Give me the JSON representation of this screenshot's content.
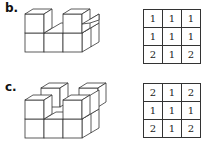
{
  "problems": [
    {
      "label": "b.",
      "grid": [
        [
          "1",
          "1",
          "1"
        ],
        [
          "1",
          "1",
          "1"
        ],
        [
          "2",
          "1",
          "2"
        ]
      ]
    },
    {
      "label": "c.",
      "grid": [
        [
          "2",
          "1",
          "2"
        ],
        [
          "1",
          "1",
          "1"
        ],
        [
          "2",
          "1",
          "2"
        ]
      ]
    }
  ],
  "colors": {
    "line": "#333333",
    "background": "#ffffff"
  }
}
